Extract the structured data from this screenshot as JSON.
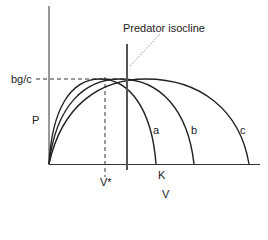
{
  "diagram": {
    "type": "predator-prey isocline diagram",
    "axes": {
      "x_label": "V",
      "y_label": "P"
    },
    "annotations": {
      "isocline_label": "Predator isocline",
      "y_marker_label": "bg/c",
      "x_marker_label": "V*",
      "k_label": "K"
    },
    "curves": [
      {
        "id": "a",
        "label": "a"
      },
      {
        "id": "b",
        "label": "b"
      },
      {
        "id": "c",
        "label": "c"
      }
    ],
    "colors": {
      "line": "#222222",
      "isocline": "#555555",
      "dashed": "#333333"
    }
  }
}
